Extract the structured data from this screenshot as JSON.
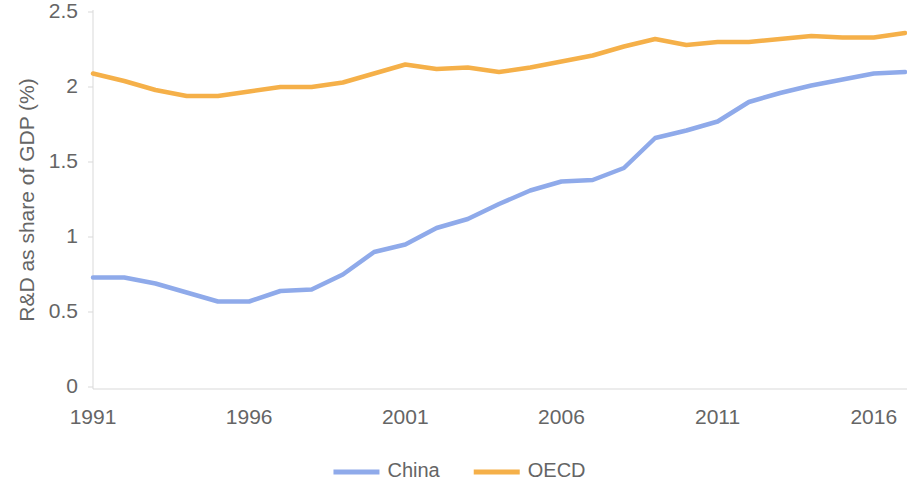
{
  "chart_data": {
    "type": "line",
    "title": "",
    "subtitle": "",
    "xlabel": "",
    "ylabel": "R&D as share of GDP (%)",
    "xlim": [
      1991,
      2017
    ],
    "ylim": [
      0,
      2.5
    ],
    "ytick_labels": [
      "0",
      "0.5",
      "1",
      "1.5",
      "2",
      "2.5"
    ],
    "ytick_values": [
      0,
      0.5,
      1,
      1.5,
      2,
      2.5
    ],
    "xtick_labels": [
      "1991",
      "1996",
      "2001",
      "2006",
      "2011",
      "2016"
    ],
    "xtick_values": [
      1991,
      1996,
      2001,
      2006,
      2011,
      2016
    ],
    "grid": false,
    "legend_position": "bottom",
    "x": [
      1991,
      1992,
      1993,
      1994,
      1995,
      1996,
      1997,
      1998,
      1999,
      2000,
      2001,
      2002,
      2003,
      2004,
      2005,
      2006,
      2007,
      2008,
      2009,
      2010,
      2011,
      2012,
      2013,
      2014,
      2015,
      2016,
      2017
    ],
    "series": [
      {
        "name": "China",
        "color": "#8faaea",
        "values": [
          0.73,
          0.73,
          0.69,
          0.63,
          0.57,
          0.57,
          0.64,
          0.65,
          0.75,
          0.9,
          0.95,
          1.06,
          1.12,
          1.22,
          1.31,
          1.37,
          1.38,
          1.46,
          1.66,
          1.71,
          1.77,
          1.9,
          1.96,
          2.01,
          2.05,
          2.09,
          2.1
        ]
      },
      {
        "name": "OECD",
        "color": "#f5b049",
        "values": [
          2.09,
          2.04,
          1.98,
          1.94,
          1.94,
          1.97,
          2.0,
          2.0,
          2.03,
          2.09,
          2.15,
          2.12,
          2.13,
          2.1,
          2.13,
          2.17,
          2.21,
          2.27,
          2.32,
          2.28,
          2.3,
          2.3,
          2.32,
          2.34,
          2.33,
          2.33,
          2.36
        ]
      }
    ]
  },
  "legend": {
    "items": [
      {
        "label": "China",
        "color": "#8faaea"
      },
      {
        "label": "OECD",
        "color": "#f5b049"
      }
    ]
  },
  "axis": {
    "y_title": "R&D as share of GDP (%)"
  }
}
